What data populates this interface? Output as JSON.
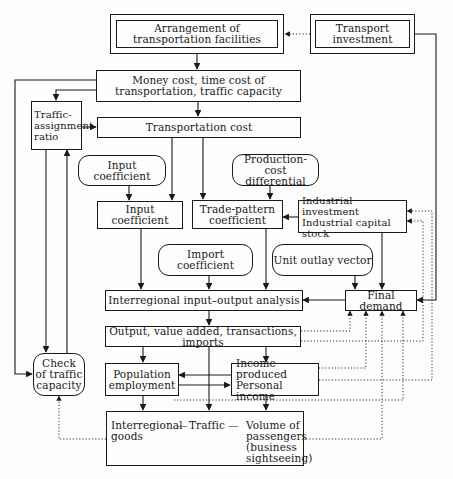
{
  "diagram": {
    "nodes": {
      "arrangement": "Arrangement of\ntransportation facilities",
      "transport_investment": "Transport\ninvestment",
      "money_cost": "Money cost, time cost of\ntransportation, traffic capacity",
      "traffic_assignment": "Traffic-\nassignment\nratio",
      "transportation_cost": "Transportation cost",
      "input_coefficient_exog": "Input coefficient",
      "production_cost": "Production-cost\ndifferential",
      "input_coefficient": "Input coefficient",
      "trade_pattern": "Trade-pattern\ncoefficient",
      "industrial_investment": "Industrial investment\nIndustrial capital stock",
      "import_coefficient": "Import coefficient",
      "unit_outlay": "Unit outlay vector",
      "interregional_io": "Interregional input–output analysis",
      "final_demand": "Final demand",
      "output": "Output, value added, transactions, imports",
      "check_traffic": "Check\nof traffic\ncapacity",
      "population": "Population\nemployment",
      "income": "Income produced\nPersonal income",
      "bottom_interregional": "Interregional\ngoods",
      "bottom_dash1": "—",
      "bottom_traffic": "Traffic",
      "bottom_dash2": "—",
      "bottom_passengers": "Volume of\npassengers\n(business\nsightseeing)"
    },
    "edges": [
      {
        "from": "transport_investment",
        "to": "arrangement",
        "style": "dotted"
      },
      {
        "from": "transport_investment",
        "to": "final_demand",
        "style": "solid"
      },
      {
        "from": "arrangement",
        "to": "money_cost",
        "style": "solid"
      },
      {
        "from": "money_cost",
        "to": "traffic_assignment",
        "style": "solid"
      },
      {
        "from": "money_cost",
        "to": "check_traffic",
        "style": "solid"
      },
      {
        "from": "money_cost",
        "to": "transportation_cost",
        "style": "solid"
      },
      {
        "from": "traffic_assignment",
        "to": "transportation_cost",
        "style": "solid"
      },
      {
        "from": "traffic_assignment",
        "to": "check_traffic",
        "style": "solid"
      },
      {
        "from": "check_traffic",
        "to": "traffic_assignment",
        "style": "solid"
      },
      {
        "from": "transportation_cost",
        "to": "input_coefficient",
        "style": "solid"
      },
      {
        "from": "transportation_cost",
        "to": "trade_pattern",
        "style": "solid"
      },
      {
        "from": "input_coefficient_exog",
        "to": "input_coefficient",
        "style": "solid"
      },
      {
        "from": "production_cost",
        "to": "trade_pattern",
        "style": "solid"
      },
      {
        "from": "industrial_investment",
        "to": "trade_pattern",
        "style": "solid"
      },
      {
        "from": "industrial_investment",
        "to": "final_demand",
        "style": "solid"
      },
      {
        "from": "input_coefficient",
        "to": "interregional_io",
        "style": "solid"
      },
      {
        "from": "import_coefficient",
        "to": "interregional_io",
        "style": "solid"
      },
      {
        "from": "trade_pattern",
        "to": "interregional_io",
        "style": "solid"
      },
      {
        "from": "unit_outlay",
        "to": "final_demand",
        "style": "solid"
      },
      {
        "from": "final_demand",
        "to": "interregional_io",
        "style": "solid"
      },
      {
        "from": "interregional_io",
        "to": "output",
        "style": "solid"
      },
      {
        "from": "output",
        "to": "population",
        "style": "solid"
      },
      {
        "from": "output",
        "to": "income",
        "style": "solid"
      },
      {
        "from": "output",
        "to": "bottom_traffic",
        "style": "solid"
      },
      {
        "from": "output",
        "to": "final_demand",
        "style": "dotted"
      },
      {
        "from": "output",
        "to": "industrial_investment",
        "style": "dotted"
      },
      {
        "from": "income",
        "to": "population",
        "style": "solid"
      },
      {
        "from": "population",
        "to": "income",
        "style": "solid"
      },
      {
        "from": "income",
        "to": "final_demand",
        "style": "dotted"
      },
      {
        "from": "income",
        "to": "industrial_investment",
        "style": "dotted"
      },
      {
        "from": "population",
        "to": "bottom_traffic",
        "style": "solid"
      },
      {
        "from": "income",
        "to": "bottom_traffic",
        "style": "solid"
      },
      {
        "from": "bottom_traffic",
        "to": "check_traffic",
        "style": "dotted"
      },
      {
        "from": "bottom_traffic",
        "to": "final_demand",
        "style": "dotted"
      }
    ]
  }
}
